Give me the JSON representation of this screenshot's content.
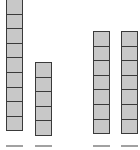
{
  "diagram": {
    "type": "unit-block-stacks",
    "block_color": "#c8c8c8",
    "border_color": "#3a3a3a",
    "stacks": [
      {
        "name": "stack-1",
        "blocks": 9,
        "x": 6,
        "top": -1
      },
      {
        "name": "stack-2",
        "blocks": 5,
        "x": 35,
        "top": 62
      },
      {
        "name": "stack-3",
        "blocks": 7,
        "x": 93,
        "top": 31
      },
      {
        "name": "stack-4",
        "blocks": 7,
        "x": 121,
        "top": 31
      }
    ],
    "labels_note": "Labels beneath stacks are cut off at image bottom edge and unreadable"
  }
}
